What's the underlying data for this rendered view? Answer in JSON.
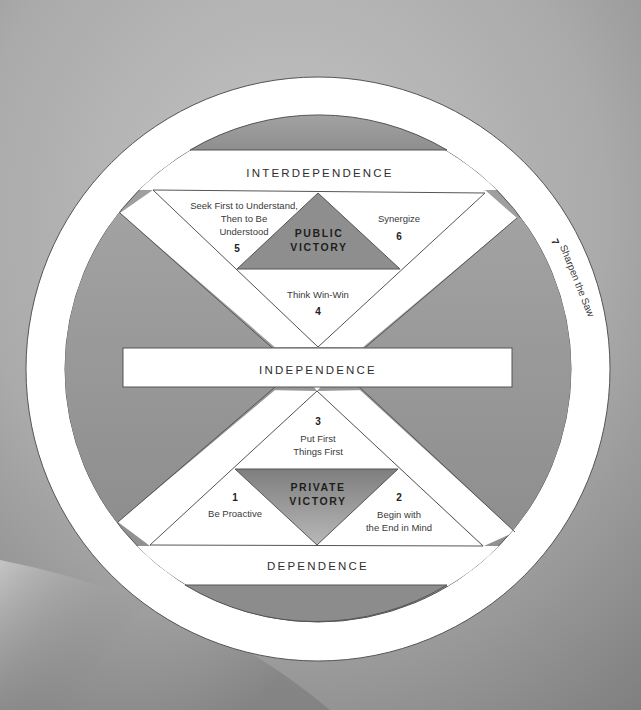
{
  "diagram": {
    "levels": {
      "top": "INTERDEPENDENCE",
      "middle": "INDEPENDENCE",
      "bottom": "DEPENDENCE"
    },
    "victories": {
      "public": {
        "line1": "PUBLIC",
        "line2": "VICTORY"
      },
      "private": {
        "line1": "PRIVATE",
        "line2": "VICTORY"
      }
    },
    "habits": [
      {
        "number": "1",
        "lines": [
          "Be Proactive"
        ]
      },
      {
        "number": "2",
        "lines": [
          "Begin with",
          "the End in Mind"
        ]
      },
      {
        "number": "3",
        "lines": [
          "Put First",
          "Things First"
        ]
      },
      {
        "number": "4",
        "lines": [
          "Think Win-Win"
        ]
      },
      {
        "number": "5",
        "lines": [
          "Seek First to Understand,",
          "Then to Be",
          "Understood"
        ]
      },
      {
        "number": "6",
        "lines": [
          "Synergize"
        ]
      },
      {
        "number": "7",
        "lines": [
          "Sharpen the Saw"
        ]
      }
    ],
    "colors": {
      "background": "#b4b4b4",
      "ring": "#ffffff",
      "wedge": "#9a9a9a",
      "victory_fill": "#8f8f8f",
      "stroke": "#555555",
      "text": "#2e2e2e"
    }
  }
}
